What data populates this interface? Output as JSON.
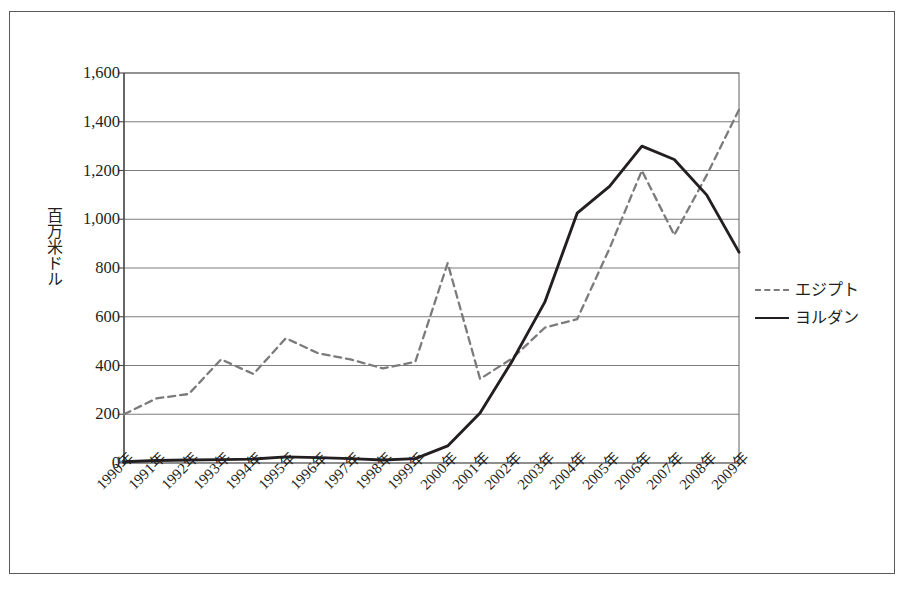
{
  "figure": {
    "frame_border_color": "#5a5a5a",
    "background": "#ffffff"
  },
  "chart_data": {
    "type": "line",
    "title": "",
    "subtitle": "",
    "xlabel": "",
    "ylabel": "百万米ドル",
    "ylim": [
      0,
      1600
    ],
    "ytick_values": [
      0,
      200,
      400,
      600,
      800,
      1000,
      1200,
      1400,
      1600
    ],
    "ytick_labels": [
      "0",
      "200",
      "400",
      "600",
      "800",
      "1,000",
      "1,200",
      "1,400",
      "1,600"
    ],
    "grid": true,
    "grid_axis": "y",
    "grid_color": "#6e6e6e",
    "legend_position": "right",
    "categories": [
      "1990年",
      "1991年",
      "1992年",
      "1993年",
      "1994年",
      "1995年",
      "1996年",
      "1997年",
      "1998年",
      "1999年",
      "2000年",
      "2001年",
      "2002年",
      "2003年",
      "2004年",
      "2005年",
      "2006年",
      "2007年",
      "2008年",
      "2009年"
    ],
    "x_values": [
      1990,
      1991,
      1992,
      1993,
      1994,
      1995,
      1996,
      1997,
      1998,
      1999,
      2000,
      2001,
      2002,
      2003,
      2004,
      2005,
      2006,
      2007,
      2008,
      2009
    ],
    "series": [
      {
        "name": "エジプト",
        "style": "dashed",
        "color": "#7b7b7b",
        "values": [
          200,
          265,
          283,
          425,
          365,
          512,
          450,
          425,
          388,
          415,
          820,
          345,
          430,
          555,
          590,
          880,
          1200,
          935,
          1180,
          1450
        ]
      },
      {
        "name": "ヨルダン",
        "style": "solid",
        "color": "#231f20",
        "values": [
          5,
          10,
          12,
          14,
          16,
          25,
          22,
          18,
          12,
          18,
          70,
          205,
          420,
          660,
          1025,
          1135,
          1300,
          1245,
          1100,
          865
        ]
      }
    ]
  },
  "legend": {
    "items": [
      {
        "label": "エジプト",
        "style": "dashed",
        "color": "#7b7b7b"
      },
      {
        "label": "ヨルダン",
        "style": "solid",
        "color": "#231f20"
      }
    ]
  }
}
